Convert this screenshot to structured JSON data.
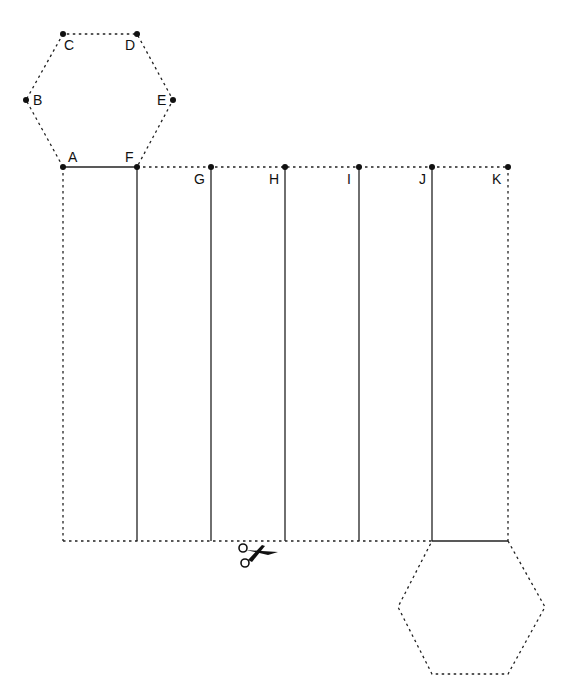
{
  "diagram": {
    "top_hexagon_points": {
      "A": {
        "label": "A",
        "x": 63,
        "y": 167
      },
      "B": {
        "label": "B",
        "x": 26,
        "y": 100
      },
      "C": {
        "label": "C",
        "x": 63,
        "y": 34
      },
      "D": {
        "label": "D",
        "x": 137,
        "y": 34
      },
      "E": {
        "label": "E",
        "x": 173,
        "y": 100
      },
      "F": {
        "label": "F",
        "x": 137,
        "y": 167
      }
    },
    "rectangle_top_points": {
      "G": {
        "label": "G",
        "x": 211,
        "y": 167
      },
      "H": {
        "label": "H",
        "x": 285,
        "y": 167
      },
      "I": {
        "label": "I",
        "x": 359,
        "y": 167
      },
      "J": {
        "label": "J",
        "x": 432,
        "y": 167
      },
      "K": {
        "label": "K",
        "x": 508,
        "y": 167
      }
    },
    "rectangle": {
      "left": 63,
      "top": 167,
      "right": 508,
      "bottom": 541
    },
    "fold_lines_x": [
      137,
      211,
      285,
      359,
      432
    ],
    "bottom_hexagon": [
      [
        432,
        541
      ],
      [
        508,
        541
      ],
      [
        545,
        607
      ],
      [
        508,
        674
      ],
      [
        432,
        674
      ],
      [
        398,
        607
      ]
    ],
    "icons": {
      "scissors": "scissors-icon"
    },
    "colors": {
      "line": "#222222",
      "background": "#ffffff"
    }
  }
}
